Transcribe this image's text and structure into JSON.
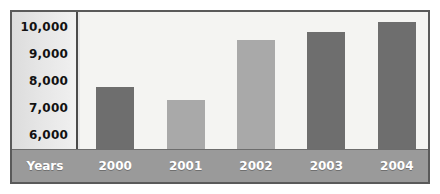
{
  "chart_data": {
    "type": "bar",
    "title": "",
    "xlabel": "Years",
    "ylabel": "",
    "categories": [
      "2000",
      "2001",
      "2002",
      "2003",
      "2004"
    ],
    "values": [
      7800,
      7350,
      9450,
      9750,
      10100
    ],
    "ytick_labels": [
      "10,000",
      "9,000",
      "8,000",
      "7,000",
      "6,000"
    ],
    "ytick_values": [
      10000,
      9000,
      8000,
      7000,
      6000
    ],
    "ylim": [
      5600,
      10450
    ],
    "grid": false,
    "legend": null,
    "bar_colors": [
      "#6e6e6e",
      "#a9a9a9",
      "#a9a9a9",
      "#6e6e6e",
      "#6e6e6e"
    ],
    "colors": {
      "bar_dark": "#6e6e6e",
      "bar_light": "#a9a9a9",
      "plot_background": "#f4f4f2",
      "axis_band": "#9a9a9a",
      "frame": "#5a5a5a",
      "label_text": "#121212",
      "band_text": "#ffffff"
    }
  }
}
